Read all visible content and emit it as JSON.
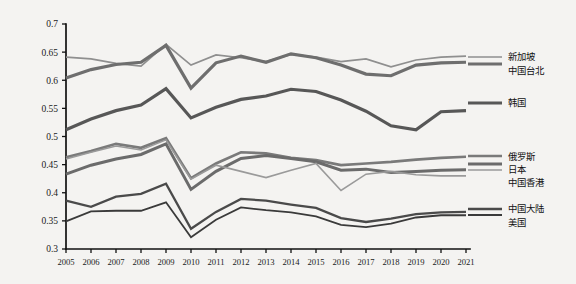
{
  "chart_data": {
    "type": "line",
    "title": "",
    "subtitle": "",
    "xlabel": "",
    "ylabel": "",
    "xlim": [
      2005,
      2021
    ],
    "ylim": [
      0.3,
      0.7
    ],
    "ytick_labels": [
      "0.7",
      "0.65",
      "0.6",
      "0.55",
      "0.5",
      "0.45",
      "0.4",
      "0.35",
      "0.3"
    ],
    "ytick_values": [
      0.7,
      0.65,
      0.6,
      0.55,
      0.5,
      0.45,
      0.4,
      0.35,
      0.3
    ],
    "grid": false,
    "legend_position": "right",
    "categories": [
      2005,
      2006,
      2007,
      2008,
      2009,
      2010,
      2011,
      2012,
      2013,
      2014,
      2015,
      2016,
      2017,
      2018,
      2019,
      2020,
      2021
    ],
    "xtick_labels": [
      "2005",
      "2006",
      "2007",
      "2008",
      "2009",
      "2010",
      "2011",
      "2012",
      "2013",
      "2014",
      "2015",
      "2016",
      "2017",
      "2018",
      "2019",
      "2020",
      "2021"
    ],
    "series": [
      {
        "name": "新加坡",
        "color": "#8f8f8f",
        "width": 1.7,
        "values": [
          0.641,
          0.638,
          0.63,
          0.625,
          0.664,
          0.627,
          0.645,
          0.64,
          0.633,
          0.646,
          0.641,
          0.633,
          0.638,
          0.624,
          0.636,
          0.641,
          0.643
        ]
      },
      {
        "name": "中国台北",
        "color": "#6e6e6e",
        "width": 3.2,
        "values": [
          0.604,
          0.619,
          0.628,
          0.632,
          0.662,
          0.586,
          0.631,
          0.643,
          0.632,
          0.647,
          0.64,
          0.627,
          0.611,
          0.608,
          0.627,
          0.631,
          0.632
        ]
      },
      {
        "name": "韩国",
        "color": "#575757",
        "width": 3.2,
        "values": [
          0.512,
          0.531,
          0.546,
          0.556,
          0.585,
          0.533,
          0.552,
          0.566,
          0.572,
          0.584,
          0.58,
          0.565,
          0.545,
          0.519,
          0.512,
          0.544,
          0.546
        ]
      },
      {
        "name": "俄罗斯",
        "color": "#7a7a7a",
        "width": 2.7,
        "values": [
          0.463,
          0.474,
          0.487,
          0.48,
          0.497,
          0.426,
          0.452,
          0.472,
          0.47,
          0.462,
          0.458,
          0.449,
          0.452,
          0.455,
          0.459,
          0.462,
          0.464
        ]
      },
      {
        "name": "日本",
        "color": "#6b6b6b",
        "width": 3.0,
        "values": [
          0.433,
          0.449,
          0.46,
          0.468,
          0.487,
          0.406,
          0.438,
          0.461,
          0.466,
          0.461,
          0.455,
          0.44,
          0.442,
          0.436,
          0.438,
          0.44,
          0.441
        ]
      },
      {
        "name": "中国香港",
        "color": "#9a9a9a",
        "width": 1.6,
        "values": [
          0.46,
          0.472,
          0.483,
          0.476,
          0.494,
          0.424,
          0.449,
          0.438,
          0.427,
          0.44,
          0.452,
          0.404,
          0.433,
          0.438,
          0.432,
          0.43,
          0.43
        ]
      },
      {
        "name": "中国大陆",
        "color": "#4a4a4a",
        "width": 2.3,
        "values": [
          0.386,
          0.375,
          0.393,
          0.398,
          0.416,
          0.336,
          0.366,
          0.389,
          0.386,
          0.379,
          0.373,
          0.355,
          0.348,
          0.354,
          0.362,
          0.365,
          0.366
        ]
      },
      {
        "name": "美国",
        "color": "#3a3a3a",
        "width": 1.8,
        "values": [
          0.349,
          0.367,
          0.368,
          0.368,
          0.383,
          0.321,
          0.352,
          0.374,
          0.369,
          0.365,
          0.358,
          0.343,
          0.339,
          0.345,
          0.356,
          0.36,
          0.36
        ]
      }
    ],
    "legend_entries": [
      {
        "label": "新加坡",
        "series": "新加坡"
      },
      {
        "label": "中国台北",
        "series": "中国台北"
      },
      {
        "label": "韩国",
        "series": "韩国"
      },
      {
        "label": "俄罗斯",
        "series": "俄罗斯"
      },
      {
        "label": "日本",
        "series": "日本"
      },
      {
        "label": "中国香港",
        "series": "中国香港"
      },
      {
        "label": "中国大陆",
        "series": "中国大陆"
      },
      {
        "label": "美国",
        "series": "美国"
      }
    ]
  }
}
